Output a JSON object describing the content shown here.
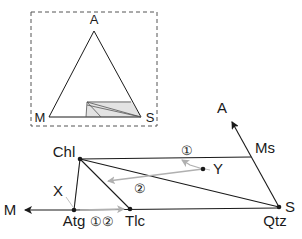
{
  "inset": {
    "labels": {
      "apex": "A",
      "left": "M",
      "right": "S"
    },
    "border_color": "#555555",
    "shade_color": "#d9d9d9"
  },
  "main": {
    "phases": {
      "chl": "Chl",
      "ms": "Ms",
      "qtz": "Qtz",
      "atg": "Atg",
      "tlc": "Tlc"
    },
    "poles": {
      "m": "M",
      "a": "A",
      "s": "S"
    },
    "points": {
      "x": "X",
      "y": "Y"
    },
    "reaction_markers": {
      "one": "①",
      "two": "②",
      "atg_markers": "①②"
    },
    "line_color": "#1a1a1a",
    "reaction_arrow_color": "#b0b0b0"
  }
}
